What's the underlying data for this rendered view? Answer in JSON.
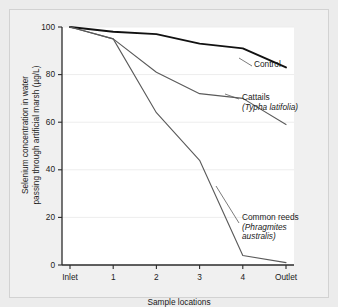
{
  "figure": {
    "background_color": "#ececec",
    "plot_background_color": "#ffffff"
  },
  "chart_data": {
    "type": "line",
    "title": "",
    "xlabel": "Sample locations",
    "ylabel": "Selenium concentration in water passing through artificial marsh (µg/L)",
    "ylabel_line1": "Selenium concentration in water",
    "ylabel_line2": "passing through artificial marsh (µg/L)",
    "categories": [
      "Inlet",
      "1",
      "2",
      "3",
      "4",
      "Outlet"
    ],
    "x": [
      0,
      1,
      2,
      3,
      4,
      5
    ],
    "ylim": [
      0,
      100
    ],
    "yticks": [
      0,
      20,
      40,
      60,
      80,
      100
    ],
    "ytick_labels": [
      "0",
      "20",
      "40",
      "60",
      "80",
      "100"
    ],
    "grid": true,
    "grid_axis": "y",
    "legend_position": "inline-annotations",
    "series": [
      {
        "name": "Control",
        "label_lines": [
          "Control"
        ],
        "color": "#111111",
        "line_width": 1.9,
        "values": [
          100,
          98,
          97,
          93,
          91,
          83
        ]
      },
      {
        "name": "Cattails (Typha latifolia)",
        "label_lines": [
          "Cattails",
          "(Typha latifolia)"
        ],
        "label_italic_lines": [
          false,
          true
        ],
        "color": "#5a5a5a",
        "line_width": 1.1,
        "values": [
          100,
          95,
          81,
          72,
          70,
          59
        ]
      },
      {
        "name": "Common reeds (Phragmites australis)",
        "label_lines": [
          "Common reeds",
          "(Phragmites",
          "australis)"
        ],
        "label_italic_lines": [
          false,
          true,
          true
        ],
        "color": "#5a5a5a",
        "line_width": 1.1,
        "values": [
          100,
          95,
          64,
          44,
          4,
          1
        ]
      }
    ],
    "annotations": [
      {
        "name": "control-label",
        "text": "Control"
      },
      {
        "name": "cattails-label",
        "text": "Cattails (Typha latifolia)"
      },
      {
        "name": "common-reeds-label",
        "text": "Common reeds (Phragmites australis)"
      }
    ]
  }
}
